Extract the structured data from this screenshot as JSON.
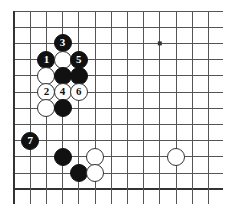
{
  "diagram": {
    "type": "go-board-diagram",
    "board": {
      "visible_columns": 13,
      "visible_rows": 12,
      "cell_px": 16.2,
      "origin_x": 14,
      "origin_y": 11,
      "line_color": "#555555",
      "edge_color": "#333333",
      "background_color": "#ffffff",
      "left_edge_is_board_edge": true,
      "bottom_edge_is_board_edge": true,
      "top_edge_is_board_edge": false,
      "right_edge_is_board_edge": false
    },
    "star_points": [
      {
        "col": 9,
        "row": 2
      }
    ],
    "stones": [
      {
        "col": 3,
        "row": 2,
        "color": "black",
        "label": "3"
      },
      {
        "col": 2,
        "row": 3,
        "color": "black",
        "label": "1"
      },
      {
        "col": 3,
        "row": 3,
        "color": "white",
        "label": ""
      },
      {
        "col": 4,
        "row": 3,
        "color": "black",
        "label": "5"
      },
      {
        "col": 2,
        "row": 4,
        "color": "white",
        "label": ""
      },
      {
        "col": 3,
        "row": 4,
        "color": "black",
        "label": ""
      },
      {
        "col": 4,
        "row": 4,
        "color": "black",
        "label": ""
      },
      {
        "col": 2,
        "row": 5,
        "color": "white",
        "label": "2"
      },
      {
        "col": 3,
        "row": 5,
        "color": "white",
        "label": "4"
      },
      {
        "col": 4,
        "row": 5,
        "color": "white",
        "label": "6"
      },
      {
        "col": 2,
        "row": 6,
        "color": "white",
        "label": ""
      },
      {
        "col": 3,
        "row": 6,
        "color": "black",
        "label": ""
      },
      {
        "col": 1,
        "row": 8,
        "color": "black",
        "label": "7"
      },
      {
        "col": 3,
        "row": 9,
        "color": "black",
        "label": ""
      },
      {
        "col": 5,
        "row": 9,
        "color": "white",
        "label": ""
      },
      {
        "col": 10,
        "row": 9,
        "color": "white",
        "label": ""
      },
      {
        "col": 4,
        "row": 10,
        "color": "black",
        "label": ""
      },
      {
        "col": 5,
        "row": 10,
        "color": "white",
        "label": ""
      }
    ],
    "move_labels": [
      "1",
      "2",
      "3",
      "4",
      "5",
      "6",
      "7"
    ],
    "colors": {
      "black_stone": "#111111",
      "white_stone": "#ffffff",
      "white_stone_border": "#333333",
      "grid": "#555555",
      "board_edge": "#333333"
    }
  }
}
